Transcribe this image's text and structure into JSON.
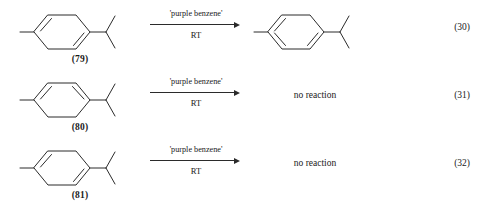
{
  "figure": {
    "kind": "chemical-reaction-scheme",
    "reaction_count": 3,
    "reagent_common": "'purple benzene'",
    "conditions_common": "RT"
  },
  "reactions": [
    {
      "eq_number": "(30)",
      "reactant": {
        "label": "(79)",
        "ring": "cyclohexadiene",
        "double_bonds": [
          "upper-left",
          "lower-right"
        ],
        "substituents": [
          "methyl",
          "isopropyl"
        ]
      },
      "reagent": "'purple benzene'",
      "conditions": "RT",
      "product": {
        "type": "structure",
        "ring": "benzene",
        "double_bonds": [
          "upper-left",
          "lower-right",
          "left"
        ],
        "substituents": [
          "methyl",
          "isopropyl"
        ],
        "text": ""
      }
    },
    {
      "eq_number": "(31)",
      "reactant": {
        "label": "(80)",
        "ring": "cyclohexadiene",
        "double_bonds": [
          "upper-left",
          "upper-right"
        ],
        "substituents": [
          "methyl",
          "isopropyl"
        ]
      },
      "reagent": "'purple benzene'",
      "conditions": "RT",
      "product": {
        "type": "text",
        "ring": "",
        "double_bonds": [],
        "substituents": [],
        "text": "no reaction"
      }
    },
    {
      "eq_number": "(32)",
      "reactant": {
        "label": "(81)",
        "ring": "cyclohexadiene",
        "double_bonds": [
          "upper-left",
          "lower-right"
        ],
        "substituents": [
          "methyl",
          "isopropyl"
        ]
      },
      "reagent": "'purple benzene'",
      "conditions": "RT",
      "product": {
        "type": "text",
        "ring": "",
        "double_bonds": [],
        "substituents": [],
        "text": "no reaction"
      }
    }
  ],
  "colors": {
    "ink": "#2b2b2b",
    "text": "#1a1a1a",
    "background": "#ffffff"
  }
}
